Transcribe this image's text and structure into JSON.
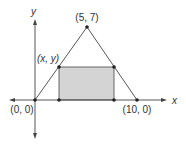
{
  "diagram": {
    "axes": {
      "x_label": "x",
      "y_label": "y"
    },
    "points": {
      "origin": "(0, 0)",
      "apex": "(5, 7)",
      "right_vertex": "(10, 0)",
      "rect_corner": "(x, y)"
    },
    "colors": {
      "line": "#444444",
      "rect_fill": "#d4d4d4",
      "dot": "#222222"
    }
  }
}
